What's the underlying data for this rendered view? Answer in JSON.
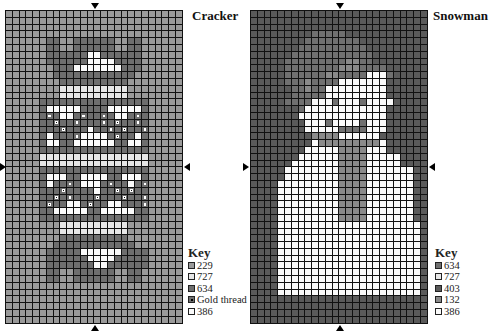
{
  "charts": [
    {
      "id": "cracker",
      "title": "Cracker",
      "key_title": "Key",
      "key": [
        {
          "code": "a",
          "label": "229",
          "color": "#9a9a9a",
          "dot": false
        },
        {
          "code": "w",
          "label": "727",
          "color": "#e6e6e6",
          "dot": false
        },
        {
          "code": "d",
          "label": "634",
          "color": "#6e6e6e",
          "dot": false
        },
        {
          "code": "g",
          "label": "Gold thread",
          "color": "#6e6e6e",
          "dot": true
        },
        {
          "code": "c",
          "label": "386",
          "color": "#fafafa",
          "dot": false
        }
      ],
      "cols": 26,
      "rows": [
        "aaaaaaaaaaaaaaaaaaaaaaaaaa",
        "aaaaaaaaaaaaaaaaaaaaaaaaaa",
        "aaaaaaaaaaaaaaaaaaaaaaaaaa",
        "aaaaaaaaaaaaaaaaaaaaaaaaaa",
        "aaaaaaddaaddddddaaddaaaaaa",
        "aaaaaaddaaddddddaaddaaaaaa",
        "aaaaaaddddddccddddddaaaaaa",
        "aaaaaaddddddccccddddaaaaaa",
        "aaaaaaadddcccccccdddaaaaaa",
        "aaaaaaaddddddddddddaaaaaaa",
        "aaaaaaaaddddddddddaaaaaaaa",
        "aaaaaaaawwwwwwwwwwaaaaaaaa",
        "aaaaaaaawwwwwwwwwwaaaaaaaa",
        "aaaaaddddddddddddddddaaaaa",
        "aaaaadcccccddddcccccdaaaaa",
        "aaaaadgdccdgddgdccdgdaaaaa",
        "aaaaaddgddgdddgdgddgdaaaaa",
        "aaaaadddgdddcddgdgddgaaaaa",
        "aaaaadcdddgccccdgddcdaaaaa",
        "aaaaadccddccccccddccdaaaaa",
        "aaaaaddddddddddddddddaaaaa",
        "aaaaawwwwwwwwwwwwwwwwaaaaa",
        "aaaaawwwwwwwwwwwwwwwwaaaaa",
        "aaaaaddddddddddddddddaaaaa",
        "aaaaadcccddccccddcccdaaaaa",
        "aaaaadcddgdcccdgddcdgaaaaa",
        "aaaaadddgddddcddgdgddaaaaa",
        "aaaaaddgdgdddgdddgddgaaaaa",
        "aaaaadgddccdgddccdddgaaaaa",
        "aaaaaddcccccddcccccddaaaaa",
        "aaaaaddddddddddddddddaaaaa",
        "aaaaaaaawwwwwwwwwwaaaaaaaa",
        "aaaaaaaawwwwwwwwwwaaaaaaaa",
        "aaaaaaaaddddddddddaaaaaaaa",
        "aaaaaaaddddddddddddaaaaaaa",
        "aaaaaadddddccccccddddaaaaa",
        "aaaaaaddddddccccdddddaaaaa",
        "aaaaaadddddddccddddddaaaaa",
        "aaaaaaddaaddddddaaddaaaaaa",
        "aaaaaaddaaddddddaaddaaaaaa",
        "aaaaaaaaaaaaaaaaaaaaaaaaaa",
        "aaaaaaaaaaaaaaaaaaaaaaaaaa",
        "aaaaaaaaaaaaaaaaaaaaaaaaaa",
        "aaaaaaaaaaaaaaaaaaaaaaaaaa",
        "aaaaaaaaaaaaaaaaaaaaaaaaaa",
        "aaaaaaaaaaaaaaaaaaaaaaaaaa"
      ]
    },
    {
      "id": "snowman",
      "title": "Snowman",
      "key_title": "Key",
      "key": [
        {
          "code": "d",
          "label": "634",
          "color": "#707070",
          "dot": false
        },
        {
          "code": "w",
          "label": "727",
          "color": "#e8e8e8",
          "dot": false
        },
        {
          "code": "b",
          "label": "403",
          "color": "#5a5a5a",
          "dot": false
        },
        {
          "code": "s",
          "label": "132",
          "color": "#8a8a8a",
          "dot": false
        },
        {
          "code": "c",
          "label": "386",
          "color": "#fafafa",
          "dot": false
        }
      ],
      "cols": 26,
      "rows": [
        "bbbbbbbbbbbbbbbbbbbbbbbbbb",
        "bbbbbbbbbbbbbbbbbbbbbbbbbb",
        "bbbbbbbbbbbbbbbbbbbbbbbbbb",
        "bbbbbbbbbdddddbbbbbbbbbbbb",
        "bbbbbbbbddddddddbbbbbbbbbb",
        "bbbbbbbddddddddddbbbbbbbbb",
        "bbbbbbddddddddddddbbbbbbbb",
        "bbbbbdddddddddssddbbbbbbbb",
        "bbbbbddddddddsssddddbbbbbb",
        "bbbbbddddddssddddcccdbbbbb",
        "bbbbbdddsddddcccccccbbbbbb",
        "bbbbbbddsddcccccccccbbbbbb",
        "bbbbbbdddddcccccccccbbbbbb",
        "bbbbbddddcccdcccdccccbbbbb",
        "bbbbbbbdccccccccccccbbbbbb",
        "bbbbbbbcccccccccccccbbbbbb",
        "bbbbbbbbcccdccccdcccbbbbbb",
        "bbbbbbbbcccccddddcccbbbbbb",
        "bbbbbbbbbssssccccccbbbbbbb",
        "bbbbbbbbbcssssssssscbbbbbb",
        "bbbbbbbbcccccsssscccbbbbbb",
        "bbbbbbbccccccsssscccccbbbb",
        "bbbbbbcccccccsssscccccbbbb",
        "bbbbbccccccccsssscccccccbb",
        "bbbbbccccccccsssscccccccbb",
        "bbbbcccccccccsssscccccccbb",
        "bbbbcccccccccsssscccccccbb",
        "bbbbcccccccccsssscccccccbb",
        "bbbbcccccccccsssscccccccbb",
        "bbbbcccccccccsssscccccccbb",
        "bbbbcccccccccsssscccccccbb",
        "bbbbcccccccccccccccccccccbb",
        "bbbbcccccccccccccccccccccbb",
        "bbbbcccccccccccccccccccccbb",
        "bbbbcccccccccccccccccccccbb",
        "bbbbcccccccccccccccccccccbb",
        "bbbbcccccccccccccccccccccbb",
        "bbbbcccccccccccccccccccccbb",
        "bbbbcccccccccccccccccccccbb",
        "bbbbcccccccccccccccccccccbb",
        "bbbbcccccccccccccccccccccbb",
        "bbbbcccccccccccccccccccccbb",
        "bbbbbbbbbbbbbbbbbbbbbbbbbb",
        "bbbbbbbbbbbbbbbbbbbbbbbbbb",
        "bbbbbbbbbbbbbbbbbbbbbbbbbb",
        "bbbbbbbbbbbbbbbbbbbbbbbbbb"
      ]
    }
  ]
}
